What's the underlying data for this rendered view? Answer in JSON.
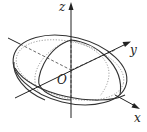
{
  "diagram": {
    "type": "3d-ellipsoid-with-axes",
    "labels": {
      "z": "z",
      "y": "y",
      "x": "x",
      "origin": "O"
    },
    "colors": {
      "stroke": "#333333",
      "dotted": "#888888",
      "background": "#ffffff"
    }
  }
}
